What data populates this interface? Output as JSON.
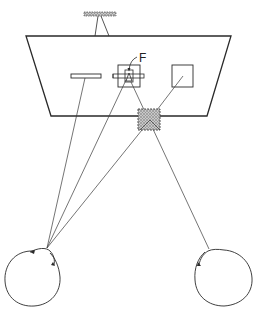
{
  "diagram": {
    "type": "optical-geometry",
    "labels": {
      "focus_label": "F"
    },
    "elements": [
      {
        "id": "light-bar",
        "kind": "hatched-bar"
      },
      {
        "id": "frame",
        "kind": "trapezoid"
      },
      {
        "id": "left-bar",
        "kind": "rectangle"
      },
      {
        "id": "center-target",
        "kind": "target-with-cross-bar"
      },
      {
        "id": "right-square",
        "kind": "square"
      },
      {
        "id": "hatched-square",
        "kind": "hatched-square"
      },
      {
        "id": "left-eye",
        "kind": "eye"
      },
      {
        "id": "right-eye",
        "kind": "eye"
      }
    ],
    "colors": {
      "stroke": "#2a2a2a",
      "hatch": "#9a9a9a",
      "background": "#ffffff"
    }
  }
}
